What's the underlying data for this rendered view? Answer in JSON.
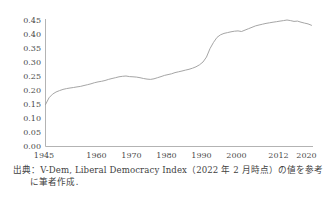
{
  "chart_data": {
    "type": "line",
    "title": "",
    "series_name": "Liberal Democracy Index (world average)",
    "xlabel": "",
    "ylabel": "",
    "ylim": [
      0.0,
      0.45
    ],
    "y_ticks": [
      0.0,
      0.05,
      0.1,
      0.15,
      0.2,
      0.25,
      0.3,
      0.35,
      0.4,
      0.45
    ],
    "x_ticks": [
      1945,
      1960,
      1970,
      1980,
      1990,
      2000,
      2012,
      2020
    ],
    "grid": false,
    "legend": "none",
    "line_color": "#9b9b9b",
    "axis_color": "#b3b3b3",
    "x": [
      1945,
      1946,
      1947,
      1948,
      1949,
      1950,
      1951,
      1952,
      1953,
      1954,
      1955,
      1956,
      1957,
      1958,
      1959,
      1960,
      1961,
      1962,
      1963,
      1964,
      1965,
      1966,
      1967,
      1968,
      1969,
      1970,
      1971,
      1972,
      1973,
      1974,
      1975,
      1976,
      1977,
      1978,
      1979,
      1980,
      1981,
      1982,
      1983,
      1984,
      1985,
      1986,
      1987,
      1988,
      1989,
      1990,
      1991,
      1992,
      1993,
      1994,
      1995,
      1996,
      1997,
      1998,
      1999,
      2000,
      2001,
      2002,
      2003,
      2004,
      2005,
      2006,
      2007,
      2008,
      2009,
      2010,
      2011,
      2012,
      2013,
      2014,
      2015,
      2016,
      2017,
      2018,
      2019,
      2020,
      2021
    ],
    "values": [
      0.148,
      0.172,
      0.185,
      0.193,
      0.198,
      0.202,
      0.205,
      0.207,
      0.209,
      0.211,
      0.213,
      0.216,
      0.219,
      0.222,
      0.226,
      0.229,
      0.231,
      0.234,
      0.238,
      0.241,
      0.244,
      0.247,
      0.249,
      0.25,
      0.248,
      0.247,
      0.246,
      0.244,
      0.241,
      0.239,
      0.238,
      0.24,
      0.244,
      0.248,
      0.252,
      0.255,
      0.258,
      0.262,
      0.265,
      0.268,
      0.271,
      0.274,
      0.278,
      0.283,
      0.29,
      0.3,
      0.318,
      0.348,
      0.37,
      0.388,
      0.397,
      0.402,
      0.405,
      0.408,
      0.41,
      0.411,
      0.409,
      0.414,
      0.419,
      0.424,
      0.429,
      0.432,
      0.435,
      0.438,
      0.44,
      0.442,
      0.444,
      0.446,
      0.448,
      0.45,
      0.448,
      0.445,
      0.446,
      0.442,
      0.439,
      0.436,
      0.431
    ]
  },
  "source": {
    "line1": "出典：V-Dem, Liberal Democracy Index（2022 年 2 月時点）の値を参考",
    "line2": "に筆者作成．"
  }
}
